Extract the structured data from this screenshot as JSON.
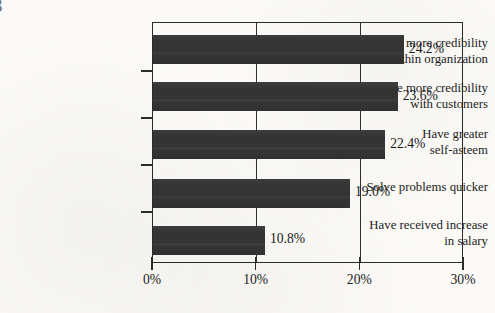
{
  "corner_mark": "3",
  "chart_data": {
    "type": "bar",
    "orientation": "horizontal",
    "title": "",
    "subtitle": "",
    "xlabel": "",
    "ylabel": "",
    "categories": [
      "Have more credibility\nwithin organization",
      "Have more credibility\nwith customers",
      "Have greater\nself-asteem",
      "Solve problems quicker",
      "Have received increase\nin salary"
    ],
    "values": [
      24.2,
      23.6,
      22.4,
      19.0,
      10.8
    ],
    "value_labels": [
      "24.2%",
      "23.6%",
      "22.4%",
      "19.0%",
      "10.8%"
    ],
    "xlim": [
      0,
      30
    ],
    "xticks": [
      0,
      10,
      20,
      30
    ],
    "xtick_labels": [
      "0%",
      "10%",
      "20%",
      "30%"
    ],
    "grid": "vertical",
    "legend": "none",
    "bar_color": "#343434",
    "frame_color": "#2b2b2b",
    "background_color": "#fbfaf7"
  }
}
